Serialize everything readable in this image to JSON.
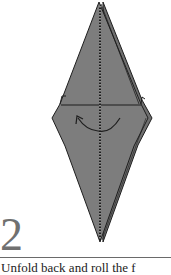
{
  "step": {
    "number": "2",
    "caption": "Unfold back and roll the f"
  },
  "colors": {
    "paper": "#7d7d7d",
    "paper_back": "#6f6f6f",
    "outline": "#1e1e1e",
    "crease": "#ffffff",
    "step_number": "#707070"
  },
  "diagram": {
    "arrow": "curved fold arrow pointing left",
    "crease": "vertical valley fold line (dashed)"
  }
}
